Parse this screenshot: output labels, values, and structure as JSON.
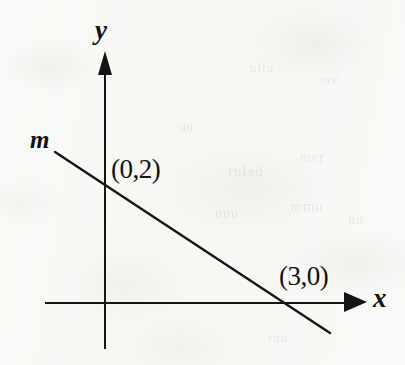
{
  "figure": {
    "background_color": "#f8f8f6",
    "ink_color": "#141414"
  },
  "axes": {
    "x_axis_label": "x",
    "y_axis_label": "y",
    "origin_px": [
      106,
      303
    ],
    "x_axis_span_px": [
      45,
      366
    ],
    "y_axis_span_px": [
      52,
      348
    ],
    "x_arrow_direction": "right",
    "y_arrow_direction": "up",
    "ticks": [],
    "gridlines": false
  },
  "line": {
    "name": "m",
    "label": "m",
    "label_position_px": [
      40,
      140
    ],
    "start_px": [
      55,
      152
    ],
    "end_px": [
      330,
      333
    ],
    "stroke_width": 2.4,
    "color": "#141414"
  },
  "annotations": [
    {
      "name": "y-intercept-label",
      "text": "(0,2)",
      "point": [
        0,
        2
      ],
      "marker_px": [
        106,
        185
      ],
      "label_px": [
        112,
        158
      ]
    },
    {
      "name": "x-intercept-label",
      "text": "(3,0)",
      "point": [
        3,
        0
      ],
      "marker_px": [
        288,
        303
      ],
      "label_px": [
        280,
        265
      ]
    }
  ],
  "bleed_through": [
    {
      "text": "ruled",
      "left": 228,
      "top": 163,
      "size": 15
    },
    {
      "text": "mer",
      "left": 300,
      "top": 150,
      "size": 14
    },
    {
      "text": "uuu",
      "left": 215,
      "top": 206,
      "size": 14
    },
    {
      "text": "mmu",
      "left": 290,
      "top": 198,
      "size": 15
    },
    {
      "text": "nu",
      "left": 348,
      "top": 212,
      "size": 14
    },
    {
      "text": "ullu",
      "left": 250,
      "top": 60,
      "size": 13
    },
    {
      "text": "mv",
      "left": 320,
      "top": 72,
      "size": 13
    },
    {
      "text": "uu",
      "left": 180,
      "top": 120,
      "size": 12
    },
    {
      "text": "ruu",
      "left": 268,
      "top": 330,
      "size": 13
    }
  ],
  "chart_data": {
    "type": "line",
    "title": "",
    "xlabel": "x",
    "ylabel": "y",
    "series": [
      {
        "name": "m",
        "points": [
          [
            0,
            2
          ],
          [
            3,
            0
          ]
        ],
        "equation": "2x + 3y = 6",
        "slope": -0.6667,
        "y_intercept": 2,
        "x_intercept": 3
      }
    ],
    "annotations": [
      "(0,2)",
      "(3,0)",
      "m"
    ],
    "xlim": [
      -1.1,
      4.3
    ],
    "ylim": [
      -2.7,
      4.6
    ],
    "grid": false,
    "legend": "none"
  }
}
